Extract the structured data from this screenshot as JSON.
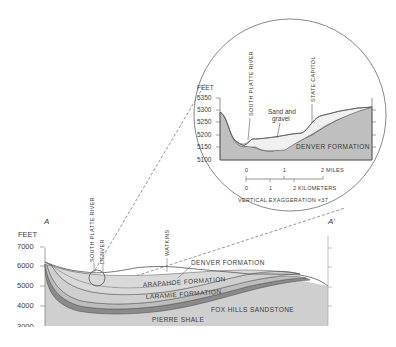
{
  "diagram": {
    "type": "geologic cross-section",
    "section_endpoints": {
      "left": "A",
      "right": "A'"
    },
    "main_section": {
      "y_axis_label": "FEET",
      "y_ticks": [
        "7000",
        "6000",
        "5000",
        "4000",
        "3000"
      ],
      "place_labels": [
        "SOUTH PLATTE RIVER",
        "DENVER",
        "WATKINS"
      ],
      "formations": [
        "DENVER FORMATION",
        "ARAPAHOE FORMATION",
        "LARAMIE FORMATION",
        "FOX HILLS SANDSTONE",
        "PIERRE SHALE"
      ]
    },
    "inset": {
      "y_axis_label": "FEET",
      "y_ticks": [
        "5350",
        "5300",
        "5250",
        "5200",
        "5150",
        "5100"
      ],
      "place_labels": [
        "SOUTH PLATTE RIVER",
        "STATE CAPITOL"
      ],
      "sand_gravel_label_1": "Sand and",
      "sand_gravel_label_2": "gravel",
      "formation_label": "DENVER FORMATION",
      "scale_miles": {
        "ticks": [
          "0",
          "1",
          "2"
        ],
        "unit": "MILES"
      },
      "scale_km": {
        "ticks": [
          "0",
          "1",
          "2"
        ],
        "unit": "KILOMETERS"
      },
      "exaggeration_note": "VERTICAL EXAGGERATION ×37"
    },
    "colors": {
      "line": "#555555",
      "fill_light": "#d4d4d4",
      "fill_mid": "#bdbdbd",
      "fill_dark": "#8a8a8a",
      "text": "#3a3a3a"
    }
  }
}
